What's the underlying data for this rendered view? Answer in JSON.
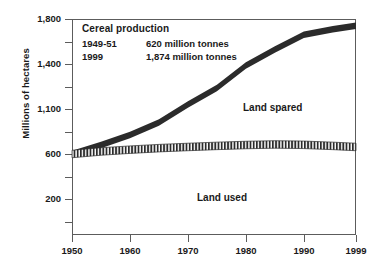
{
  "chart_data": {
    "type": "area",
    "title": "",
    "xlabel": "",
    "ylabel": "Millions of hectares",
    "x_tick_labels": [
      "1950",
      "1960",
      "1970",
      "1980",
      "1990",
      "1999"
    ],
    "y_tick_labels": [
      "1,800",
      "1,400",
      "1,100",
      "600",
      "200"
    ],
    "grid": false,
    "legend_position": "inline",
    "xlim": [
      1950,
      1999
    ],
    "ylim": [
      0,
      1800
    ],
    "series": [
      {
        "name": "Land spared",
        "label_text": "Land spared",
        "style": "solid-black-band",
        "description": "Upper boundary: land that would have been needed at 1950 yields",
        "x": [
          1950,
          1955,
          1960,
          1965,
          1970,
          1975,
          1980,
          1985,
          1990,
          1995,
          1999
        ],
        "values": [
          600,
          700,
          810,
          950,
          1130,
          1240,
          1390,
          1530,
          1660,
          1710,
          1740
        ]
      },
      {
        "name": "Land used",
        "label_text": "Land used",
        "style": "hatched-band",
        "description": "Lower boundary: actual cereal land area used",
        "x": [
          1950,
          1955,
          1960,
          1965,
          1970,
          1975,
          1980,
          1985,
          1990,
          1995,
          1999
        ],
        "values": [
          600,
          628,
          648,
          665,
          678,
          690,
          700,
          706,
          702,
          690,
          678
        ]
      }
    ],
    "annotations": {
      "title": "Cereal production",
      "rows": [
        {
          "period": "1949-51",
          "value": "620 million tonnes"
        },
        {
          "period": "1999",
          "value": "1,874 million tonnes"
        }
      ]
    }
  },
  "colors": {
    "axis": "#5c5c5c",
    "text": "#1a1a1a",
    "band_solid": "#2b2b2b",
    "band_hatch": "#2b2b2b",
    "background": "#ffffff"
  }
}
